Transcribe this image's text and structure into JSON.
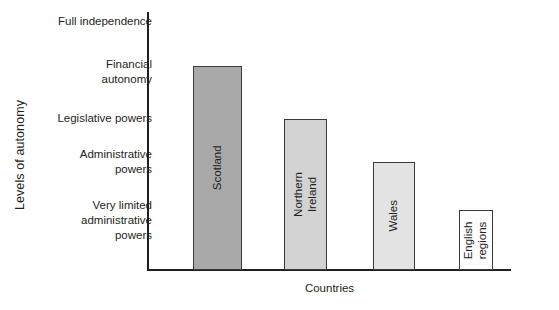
{
  "chart_data": {
    "type": "bar",
    "title": "",
    "subtitle": "",
    "xlabel": "Countries",
    "ylabel": "Levels of autonomy",
    "grid": false,
    "legend": "none",
    "orientation": "vertical",
    "axis_scale": "ordinal-categorical",
    "categories": [
      "Scotland",
      "Northern Ireland",
      "Wales",
      "English regions"
    ],
    "values": [
      4.2,
      3.1,
      2.2,
      1.2
    ],
    "value_meaning": "ordinal level of autonomy, 1 = 'Very limited administrative powers' through 5 = 'Full independence'",
    "ylim": [
      0,
      5.3
    ],
    "ytick_labels": [
      "Very limited\nadministrative\npowers",
      "Administrative\npowers",
      "Legislative powers",
      "Financial\nautonomy",
      "Full independence"
    ],
    "ytick_values": [
      1,
      2,
      3,
      4,
      5
    ],
    "series": [
      {
        "name": "Levels of autonomy",
        "points": [
          {
            "category": "Scotland",
            "value": 4.2,
            "level_text": "between Financial autonomy and Legislative powers",
            "fill": "#a9a9a9"
          },
          {
            "category": "Northern Ireland",
            "value": 3.1,
            "level_text": "Legislative powers",
            "fill": "#d3d3d3"
          },
          {
            "category": "Wales",
            "value": 2.2,
            "level_text": "Administrative powers",
            "fill": "#e3e3e3"
          },
          {
            "category": "English regions",
            "value": 1.2,
            "level_text": "Very limited administrative powers",
            "fill": "#fdfdfd"
          }
        ]
      }
    ],
    "colors": {
      "axis": "#231f20",
      "bar_border": "#3a3a3a",
      "text": "#231f20",
      "background": "#ffffff"
    }
  },
  "yticks": [
    {
      "id": "tick-full-independence",
      "label": "Full independence",
      "top": 14
    },
    {
      "id": "tick-financial-autonomy",
      "label": "Financial\nautonomy",
      "top": 57
    },
    {
      "id": "tick-legislative-powers",
      "label": "Legislative powers",
      "top": 111
    },
    {
      "id": "tick-administrative-powers",
      "label": "Administrative\npowers",
      "top": 147
    },
    {
      "id": "tick-very-limited",
      "label": "Very limited\nadministrative\npowers",
      "top": 198
    }
  ],
  "bars": [
    {
      "id": "bar-scotland",
      "label": "Scotland",
      "left": 193,
      "width": 49,
      "top": 66,
      "height": 204,
      "fill": "#a9a9a9"
    },
    {
      "id": "bar-northern-ireland",
      "label": "Northern Ireland",
      "left": 284,
      "width": 43,
      "top": 119,
      "height": 151,
      "fill": "#d3d3d3"
    },
    {
      "id": "bar-wales",
      "label": "Wales",
      "left": 373,
      "width": 42,
      "top": 162,
      "height": 108,
      "fill": "#e3e3e3"
    },
    {
      "id": "bar-english-regions",
      "label": "English\nregions",
      "left": 459,
      "width": 34,
      "top": 210,
      "height": 60,
      "fill": "#fdfdfd"
    }
  ],
  "axes": {
    "y_title": "Levels of autonomy",
    "x_title": "Countries"
  }
}
